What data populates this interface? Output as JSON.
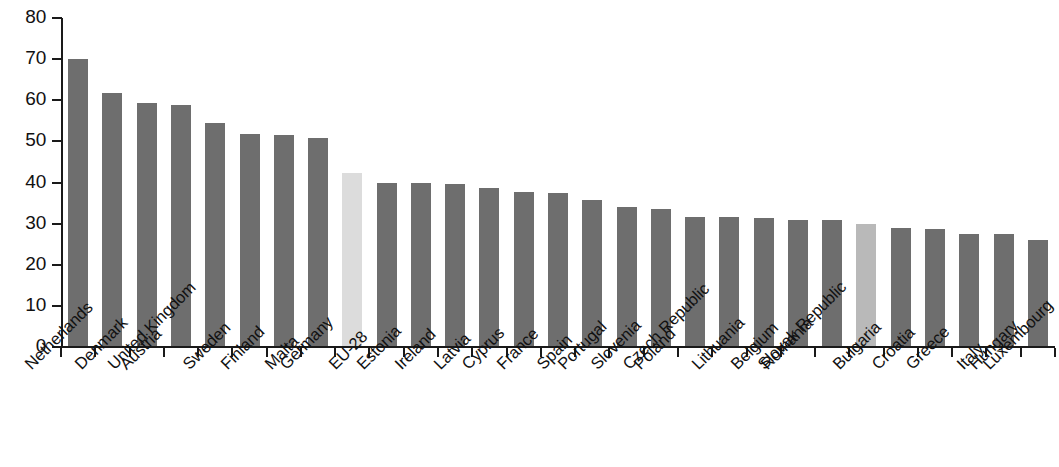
{
  "chart_data": {
    "type": "bar",
    "title": "",
    "subtitle": "",
    "xlabel": "",
    "ylabel": "",
    "ylim": [
      0,
      80
    ],
    "y_ticks": [
      0,
      10,
      20,
      30,
      40,
      50,
      60,
      70,
      80
    ],
    "grid": false,
    "legend": "none",
    "orientation": "vertical",
    "categories": [
      "Netherlands",
      "Denmark",
      "Austria",
      "United Kingdom",
      "Sweden",
      "Finland",
      "Malta",
      "Germany",
      "EU-28",
      "Estonia",
      "Ireland",
      "Latvia",
      "Cyprus",
      "France",
      "Spain",
      "Portugal",
      "Slovenia",
      "Poland",
      "Czech Republic",
      "Lithuania",
      "Belgium",
      "Romania",
      "Slovak Republic",
      "Bulgaria",
      "Croatia",
      "Greece",
      "Italy",
      "Hungary",
      "Luxembourg"
    ],
    "values": [
      70.0,
      61.7,
      59.3,
      58.8,
      54.5,
      51.8,
      51.5,
      50.8,
      42.3,
      40.0,
      39.8,
      39.6,
      38.7,
      37.8,
      37.4,
      35.8,
      34.0,
      33.6,
      31.6,
      31.7,
      31.3,
      31.0,
      31.0,
      29.8,
      29.0,
      28.7,
      27.5,
      27.4,
      26.1
    ],
    "bar_colors": [
      "#6e6e6e",
      "#6e6e6e",
      "#6e6e6e",
      "#6e6e6e",
      "#6e6e6e",
      "#6e6e6e",
      "#6e6e6e",
      "#6e6e6e",
      "#dcdcdc",
      "#6e6e6e",
      "#6e6e6e",
      "#6e6e6e",
      "#6e6e6e",
      "#6e6e6e",
      "#6e6e6e",
      "#6e6e6e",
      "#6e6e6e",
      "#6e6e6e",
      "#6e6e6e",
      "#6e6e6e",
      "#6e6e6e",
      "#6e6e6e",
      "#6e6e6e",
      "#b9b9b9",
      "#6e6e6e",
      "#6e6e6e",
      "#6e6e6e",
      "#6e6e6e",
      "#6e6e6e"
    ],
    "highlighted": [
      "EU-28",
      "Bulgaria"
    ],
    "colors": {
      "bar_default": "#6e6e6e",
      "bar_aggregate": "#dcdcdc",
      "bar_highlight": "#b9b9b9",
      "axis": "#1a1a1a",
      "text": "#111111",
      "background": "#ffffff"
    }
  }
}
